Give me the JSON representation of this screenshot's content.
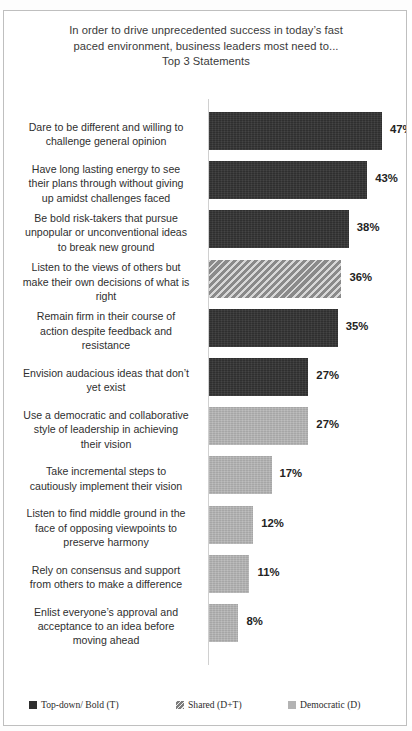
{
  "chart_data": {
    "type": "bar",
    "orientation": "horizontal",
    "title": "In order to drive unprecedented success in today’s fast paced environment, business leaders most need to... Top 3 Statements",
    "title_lines": [
      "In order to drive unprecedented success in today’s fast",
      "paced environment, business leaders most need to...",
      "Top 3 Statements"
    ],
    "xlabel": "",
    "ylabel": "",
    "grid": false,
    "axis_visible": true,
    "value_suffix": "%",
    "xlim": [
      0,
      50
    ],
    "categories": [
      "Dare to be different and willing to\nchallenge  general opinion",
      "Have long lasting energy to see\ntheir plans through without giving\nup amidst challenges faced",
      "Be bold risk-takers  that pursue\nunpopular or unconventional ideas\nto break new ground",
      "Listen to the views of others but\nmake their own decisions of what is\nright",
      "Remain firm in their course of\naction despite feedback and\nresistance",
      "Envision audacious ideas that don’t\nyet exist",
      "Use a democratic and collaborative\nstyle of leadership  in achieving\ntheir vision",
      "Take incremental steps to\ncautiously implement their vision",
      "Listen to find middle ground in the\nface of opposing viewpoints  to\npreserve harmony",
      "Rely on consensus and support\nfrom others to make a difference",
      "Enlist everyone’s approval and\nacceptance to an idea before\nmoving ahead"
    ],
    "values": [
      47,
      43,
      38,
      36,
      35,
      27,
      27,
      17,
      12,
      11,
      8
    ],
    "value_labels": [
      "47%",
      "43%",
      "38%",
      "36%",
      "35%",
      "27%",
      "27%",
      "17%",
      "12%",
      "11%",
      "8%"
    ],
    "series_of_bar": [
      "T",
      "T",
      "T",
      "D+T",
      "T",
      "T",
      "D",
      "D",
      "D",
      "D",
      "D"
    ],
    "legend": [
      {
        "label": "Top-down/ Bold (T)",
        "key": "T",
        "color": "#2f2f2f",
        "pattern": "solid"
      },
      {
        "label": "Shared (D+T)",
        "key": "D+T",
        "color": "#8d8d8d",
        "pattern": "diagonal-hatch"
      },
      {
        "label": "Democratic (D)",
        "key": "D",
        "color": "#b3b3b3",
        "pattern": "solid"
      }
    ],
    "legend_position": "bottom"
  }
}
